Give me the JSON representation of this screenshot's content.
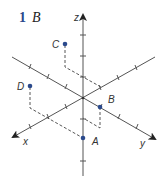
{
  "heading": {
    "number": "1",
    "letter": "B"
  },
  "axes": {
    "x": {
      "label": "x"
    },
    "y": {
      "label": "y"
    },
    "z": {
      "label": "z"
    }
  },
  "points": [
    {
      "label": "A",
      "name": "point-a"
    },
    {
      "label": "B",
      "name": "point-b"
    },
    {
      "label": "C",
      "name": "point-c"
    },
    {
      "label": "D",
      "name": "point-d"
    }
  ],
  "colors": {
    "axis": "#555555",
    "point": "#2b4a8c",
    "heading_number": "#2b4a8c",
    "dashed": "#444444"
  }
}
